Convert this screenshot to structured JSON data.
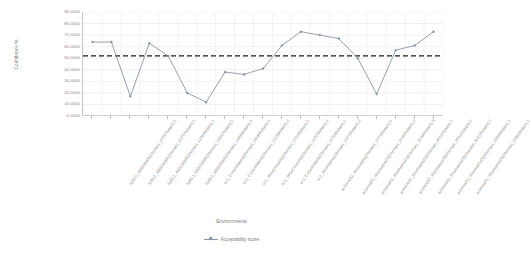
{
  "chart_data": {
    "type": "line",
    "title": "",
    "xlabel": "Environments",
    "ylabel": "Confidence %",
    "ylim": [
      0,
      90
    ],
    "ytick_step": 10,
    "ytick_labels": [
      "90.0000",
      "80.0000",
      "70.0000",
      "60.0000",
      "50.0000",
      "40.0000",
      "30.0000",
      "20.0000",
      "10.0000",
      "0.0000"
    ],
    "ytick_values": [
      90,
      80,
      70,
      60,
      50,
      40,
      30,
      20,
      10,
      0
    ],
    "grid": true,
    "legend_position": "bottom",
    "series": [
      {
        "name": "Acceptability score",
        "color": "#8896a8",
        "marker": "diamond",
        "values": [
          64.0,
          64.0,
          17.0,
          63.0,
          52.0,
          20.0,
          12.0,
          38.0,
          36.0,
          41.0,
          61.0,
          73.0,
          70.0,
          67.0,
          50.0,
          19.0,
          57.0,
          61.0,
          73.0
        ]
      }
    ],
    "reference_line": {
      "name": "threshold",
      "value": 52.0,
      "style": "dashed",
      "color": "#1a1a1a"
    },
    "categories": [
      "NJ510_ABSOBSR(Dhenani_20757Ndam),1",
      "NJ511_ABSOBSR(Dhenani_20757Ndam),1",
      "NJ512_ABSOBSR(Dhenani_22464Ndam),1",
      "NJ513_ABSOBSR(Dhenani_14087Ndam),1",
      "NJ521_ABSOBSR(Dhenani_14898Ndam),1",
      "sc1_Consolidated(Dhenani_16099Ndam),1",
      "sc1_Consolidated(Dhenani_12258Ndam),2",
      "sc1_WineConsolid(Dhenani_10728Ndam),1",
      "sc1_WineConsolid(Dhenani_32725Ndam),2",
      "sc1_Consolidated(Dhenani_10728Ndam),1",
      "sc1_Ahumados(Dhenani_10735Ndam),2",
      "achmos52_Ahumados(Dhenani_10735Ndam),1",
      "achmos52_AhumadosOf(Dhenani_30385Ndam),2",
      "achmos52_AhumadosOf(Dhenani_30385Ndam),3",
      "achmos52_AhumadosOf(Dhenani_85111Ndam),1",
      "achmos53_AhumadosOf(Dhenani_85111Ndam),2",
      "achmos53_AhumadosOf(Dhenani_80115Ndam),2",
      "achmos53_AhumadosOf(Dhenani_19585Ndam),1",
      "achmos53_AhumadosOf(Dhenani_20683Ndam),1"
    ]
  },
  "legend": {
    "items": [
      {
        "label": "Acceptability score"
      }
    ]
  }
}
